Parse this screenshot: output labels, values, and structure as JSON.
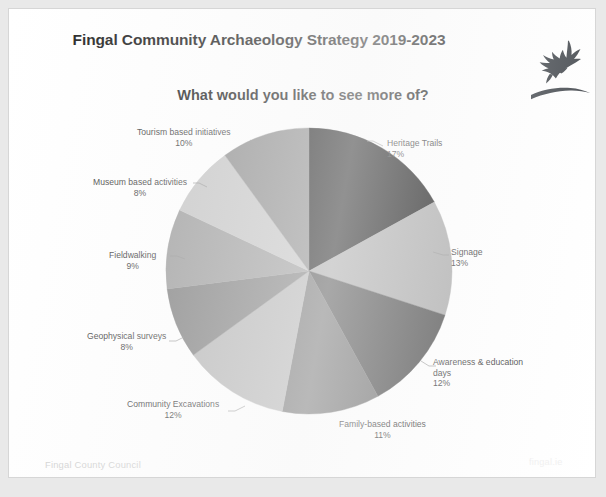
{
  "document": {
    "title": "Fingal Community Archaeology Strategy 2019-2023",
    "subtitle": "What would you like to see more of?",
    "logo_name": "fingal-eagle-logo",
    "footer_left": "Fingal County Council",
    "footer_right": "fingal.ie"
  },
  "chart_data": {
    "type": "pie",
    "title": "What would you like to see more of?",
    "legend": "labels-outside-with-leader-lines",
    "start_angle_deg": 0,
    "direction": "clockwise",
    "unit": "%",
    "categories": [
      "Heritage Trails",
      "Signage",
      "Awareness & education days",
      "Family-based activities",
      "Community Excavations",
      "Geophysical surveys",
      "Fieldwalking",
      "Museum based activities",
      "Tourism based initiatives"
    ],
    "values": [
      17,
      13,
      12,
      11,
      12,
      8,
      9,
      8,
      10
    ],
    "colors": [
      "#171717",
      "#a9a9a9",
      "#4a4a4a",
      "#6f6f6f",
      "#b4b4b4",
      "#7d7d7d",
      "#9b9b9b",
      "#c4c4c4",
      "#8a8a8a"
    ],
    "slices": [
      {
        "label": "Heritage Trails",
        "value": 17,
        "display": "17%",
        "color": "#171717"
      },
      {
        "label": "Signage",
        "value": 13,
        "display": "13%",
        "color": "#a9a9a9"
      },
      {
        "label": "Awareness & education\ndays",
        "value": 12,
        "display": "12%",
        "color": "#4a4a4a"
      },
      {
        "label": "Family-based activities",
        "value": 11,
        "display": "11%",
        "color": "#6f6f6f"
      },
      {
        "label": "Community Excavations",
        "value": 12,
        "display": "12%",
        "color": "#b4b4b4"
      },
      {
        "label": "Geophysical surveys",
        "value": 8,
        "display": "8%",
        "color": "#7d7d7d"
      },
      {
        "label": "Fieldwalking",
        "value": 9,
        "display": "9%",
        "color": "#9b9b9b"
      },
      {
        "label": "Museum based activities",
        "value": 8,
        "display": "8%",
        "color": "#c4c4c4"
      },
      {
        "label": "Tourism based initiatives",
        "value": 10,
        "display": "10%",
        "color": "#8a8a8a"
      }
    ],
    "total": 100
  }
}
